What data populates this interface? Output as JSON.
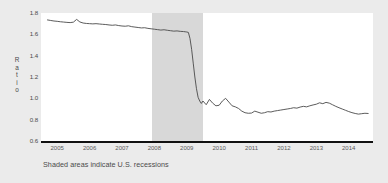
{
  "chart_data": {
    "type": "line",
    "title": "",
    "subtitle": "",
    "xlabel": "",
    "ylabel": "Ratio",
    "ylim": [
      0.6,
      1.8
    ],
    "xlim": [
      2004.5,
      2014.75
    ],
    "grid": false,
    "legend": null,
    "line_color": "#4a4a4a",
    "plot_background": "#ffffff",
    "figure_background": "#ebebeb",
    "recession_shading_color": "#d8d8d8",
    "ytick_labels": [
      "1.8",
      "1.6",
      "1.4",
      "1.2",
      "1.0",
      "0.8",
      "0.6"
    ],
    "ytick_values": [
      1.8,
      1.6,
      1.4,
      1.2,
      1.0,
      0.8,
      0.6
    ],
    "xtick_labels": [
      "2005",
      "2006",
      "2007",
      "2008",
      "2009",
      "2010",
      "2011",
      "2012",
      "2013",
      "2014"
    ],
    "xtick_values": [
      2005,
      2006,
      2007,
      2008,
      2009,
      2010,
      2011,
      2012,
      2013,
      2014
    ],
    "annotation": "Shaded areas indicate U.S. recessions",
    "recession_bands": [
      {
        "start": 2007.92,
        "end": 2009.5
      }
    ],
    "series": [
      {
        "name": "Ratio",
        "x": [
          2004.7,
          2004.8,
          2004.9,
          2005.0,
          2005.1,
          2005.2,
          2005.3,
          2005.4,
          2005.5,
          2005.6,
          2005.7,
          2005.8,
          2005.9,
          2006.0,
          2006.1,
          2006.2,
          2006.3,
          2006.4,
          2006.5,
          2006.6,
          2006.7,
          2006.8,
          2006.9,
          2007.0,
          2007.1,
          2007.2,
          2007.3,
          2007.4,
          2007.5,
          2007.6,
          2007.7,
          2007.8,
          2007.9,
          2008.0,
          2008.1,
          2008.2,
          2008.3,
          2008.4,
          2008.5,
          2008.6,
          2008.7,
          2008.8,
          2008.9,
          2008.95,
          2009.0,
          2009.05,
          2009.1,
          2009.15,
          2009.2,
          2009.25,
          2009.3,
          2009.35,
          2009.4,
          2009.45,
          2009.5,
          2009.6,
          2009.7,
          2009.8,
          2009.9,
          2010.0,
          2010.1,
          2010.2,
          2010.3,
          2010.4,
          2010.5,
          2010.6,
          2010.7,
          2010.8,
          2010.9,
          2011.0,
          2011.1,
          2011.2,
          2011.3,
          2011.4,
          2011.5,
          2011.6,
          2011.7,
          2011.8,
          2011.9,
          2012.0,
          2012.1,
          2012.2,
          2012.3,
          2012.4,
          2012.5,
          2012.6,
          2012.7,
          2012.8,
          2012.9,
          2013.0,
          2013.1,
          2013.2,
          2013.3,
          2013.4,
          2013.5,
          2013.6,
          2013.7,
          2013.8,
          2013.9,
          2014.0,
          2014.1,
          2014.2,
          2014.3,
          2014.4,
          2014.5,
          2014.6
        ],
        "y": [
          1.735,
          1.73,
          1.725,
          1.722,
          1.718,
          1.715,
          1.712,
          1.71,
          1.714,
          1.74,
          1.716,
          1.706,
          1.702,
          1.7,
          1.698,
          1.7,
          1.697,
          1.694,
          1.692,
          1.688,
          1.685,
          1.688,
          1.682,
          1.678,
          1.676,
          1.68,
          1.672,
          1.668,
          1.664,
          1.66,
          1.662,
          1.656,
          1.652,
          1.648,
          1.644,
          1.64,
          1.643,
          1.638,
          1.634,
          1.63,
          1.632,
          1.628,
          1.626,
          1.624,
          1.622,
          1.618,
          1.56,
          1.46,
          1.33,
          1.2,
          1.09,
          1.01,
          0.975,
          0.952,
          0.975,
          0.94,
          0.99,
          0.955,
          0.93,
          0.935,
          0.975,
          1.0,
          0.965,
          0.93,
          0.92,
          0.905,
          0.88,
          0.865,
          0.86,
          0.862,
          0.88,
          0.87,
          0.86,
          0.865,
          0.875,
          0.872,
          0.88,
          0.885,
          0.89,
          0.895,
          0.9,
          0.905,
          0.912,
          0.908,
          0.918,
          0.925,
          0.92,
          0.93,
          0.938,
          0.945,
          0.958,
          0.95,
          0.962,
          0.955,
          0.94,
          0.925,
          0.912,
          0.9,
          0.888,
          0.876,
          0.866,
          0.858,
          0.852,
          0.856,
          0.86,
          0.858
        ]
      }
    ]
  }
}
